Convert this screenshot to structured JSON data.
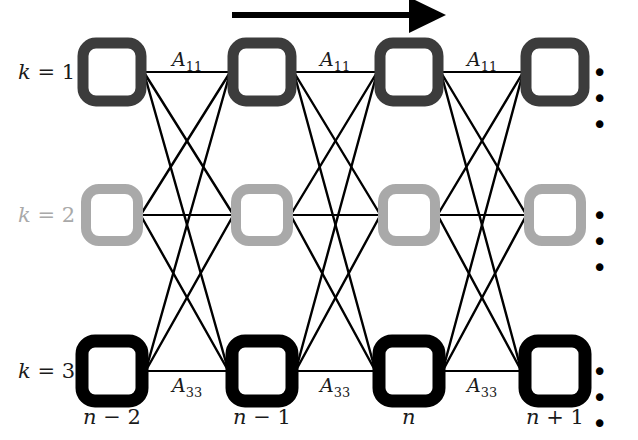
{
  "figure": {
    "type": "lattice-trellis-diagram",
    "title": "",
    "background": "#ffffff"
  },
  "colors": {
    "row1": "#3c3c3c",
    "row2": "#a9a9a9",
    "row3": "#000000",
    "edge": "#000000",
    "text": "#1a1a1a",
    "arrow": "#000000"
  },
  "arrow": {
    "name": "direction-arrow",
    "x1": 232,
    "y1": 15,
    "x2": 446,
    "y2": 15,
    "label": ""
  },
  "rows": [
    {
      "key": "k1",
      "label": "k = 1",
      "label_var": "k",
      "label_eq": "=",
      "label_num": "1",
      "y": 72,
      "color": "#3c3c3c",
      "node_size": 58,
      "stroke": 11,
      "edge_label": "A",
      "edge_sub": "11",
      "ellipsis": "• • •"
    },
    {
      "key": "k2",
      "label": "k = 2",
      "label_var": "k",
      "label_eq": "=",
      "label_num": "2",
      "y": 215,
      "color": "#a9a9a9",
      "node_size": 52,
      "stroke": 10,
      "edge_label": "",
      "edge_sub": "",
      "ellipsis": "• • •"
    },
    {
      "key": "k3",
      "label": "k = 3",
      "label_var": "k",
      "label_eq": "=",
      "label_num": "3",
      "y": 371,
      "color": "#000000",
      "node_size": 60,
      "stroke": 13,
      "edge_label": "A",
      "edge_sub": "33",
      "ellipsis": "• • •"
    }
  ],
  "columns": [
    {
      "key": "c0",
      "x": 112,
      "label": "n − 2",
      "var": "n",
      "op": "−",
      "num": "2"
    },
    {
      "key": "c1",
      "x": 262,
      "label": "n − 1",
      "var": "n",
      "op": "−",
      "num": "1"
    },
    {
      "key": "c2",
      "x": 409,
      "label": "n",
      "var": "n",
      "op": "",
      "num": ""
    },
    {
      "key": "c3",
      "x": 555,
      "label": "n + 1",
      "var": "n",
      "op": "+",
      "num": "1"
    }
  ],
  "edge_labels": {
    "row1": [
      {
        "text": "A",
        "sub": "11",
        "x": 187,
        "y": 48
      },
      {
        "text": "A",
        "sub": "11",
        "x": 335,
        "y": 48
      },
      {
        "text": "A",
        "sub": "11",
        "x": 482,
        "y": 48
      }
    ],
    "row3": [
      {
        "text": "A",
        "sub": "33",
        "x": 187,
        "y": 374
      },
      {
        "text": "A",
        "sub": "33",
        "x": 335,
        "y": 374
      },
      {
        "text": "A",
        "sub": "33",
        "x": 482,
        "y": 374
      }
    ]
  },
  "ellipses": [
    {
      "row": "k1",
      "x": 592,
      "y": 60,
      "text": "• • •"
    },
    {
      "row": "k2",
      "x": 592,
      "y": 203,
      "text": "• • •"
    },
    {
      "row": "k3",
      "x": 592,
      "y": 359,
      "text": "• • •"
    }
  ],
  "row_labels": [
    {
      "row": "k1",
      "x": 18,
      "y": 60,
      "text": "k = 1",
      "color": "#1a1a1a"
    },
    {
      "row": "k2",
      "x": 18,
      "y": 203,
      "text": "k = 2",
      "color": "#a9a9a9"
    },
    {
      "row": "k3",
      "x": 18,
      "y": 359,
      "text": "k = 3",
      "color": "#1a1a1a"
    }
  ],
  "column_labels": [
    {
      "col": "c0",
      "x": 112,
      "y": 405,
      "text": "n − 2"
    },
    {
      "col": "c1",
      "x": 262,
      "y": 405,
      "text": "n − 1"
    },
    {
      "col": "c2",
      "x": 409,
      "y": 405,
      "text": "n"
    },
    {
      "col": "c3",
      "x": 555,
      "y": 405,
      "text": "n + 1"
    }
  ]
}
